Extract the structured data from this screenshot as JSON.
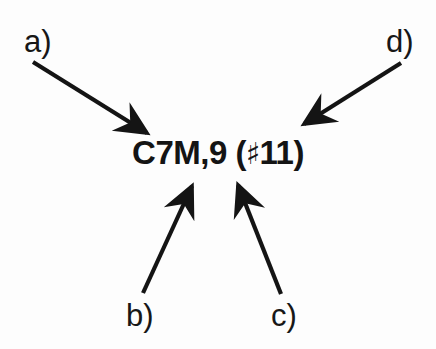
{
  "figure": {
    "background_color": "#fdfdfd",
    "ink_color": "#141414",
    "chord_symbol": {
      "full_text": "C7M,9 (♯11)",
      "root": "C",
      "seventh": "7M",
      "ninth": ",9",
      "alteration": "(♯11)",
      "sharp_sign": "♯"
    },
    "callouts": [
      {
        "id": "a",
        "label": "a)",
        "points_to": "root-and-seventh",
        "direction": "down-right"
      },
      {
        "id": "b",
        "label": "b)",
        "points_to": "seventh-quality",
        "direction": "up-right"
      },
      {
        "id": "c",
        "label": "c)",
        "points_to": "ninth",
        "direction": "up-left"
      },
      {
        "id": "d",
        "label": "d)",
        "points_to": "sharp-eleven",
        "direction": "down-left"
      }
    ],
    "arrows": [
      {
        "id": "a",
        "x1": 33,
        "y1": 62,
        "x2": 147,
        "y2": 133
      },
      {
        "id": "b",
        "x1": 143,
        "y1": 293,
        "x2": 192,
        "y2": 186
      },
      {
        "id": "c",
        "x1": 281,
        "y1": 294,
        "x2": 238,
        "y2": 185
      },
      {
        "id": "d",
        "x1": 401,
        "y1": 63,
        "x2": 304,
        "y2": 124
      }
    ]
  }
}
